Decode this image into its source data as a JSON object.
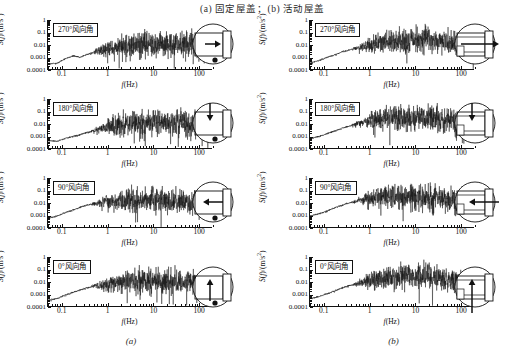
{
  "figure": {
    "top_caption_parts": [
      "(",
      "a",
      ") 固定屋盖；(",
      "b",
      ") 活动屋盖"
    ],
    "top_caption": "(a) 固定屋盖；(b) 活动屋盖",
    "bottom_caption_a": "(a)",
    "bottom_caption_b": "(b)",
    "axis": {
      "x_title_main": "f",
      "x_title_unit": "(Hz)",
      "y_title_main": "S",
      "y_title_var": "f",
      "y_title_unit": "/(m/s",
      "y_title_sup": "2",
      "y_title_close": ")",
      "x_ticks": [
        "0.1",
        "1",
        "10",
        "100"
      ],
      "y_ticks": [
        "1",
        "0.1",
        "0.01",
        "0.001",
        "0.0001"
      ],
      "x_range": [
        0.05,
        200
      ],
      "y_range": [
        0.0001,
        1
      ],
      "x_scale": "log",
      "y_scale": "log"
    },
    "columns": [
      {
        "id": "a",
        "name": "固定屋盖",
        "caption": "(a)",
        "roof_type": "fixed",
        "panels": [
          {
            "label": "270°风向角",
            "angle": 270,
            "arrow": "right"
          },
          {
            "label": "180°风向角",
            "angle": 180,
            "arrow": "down"
          },
          {
            "label": "90°风向角",
            "angle": 90,
            "arrow": "left"
          },
          {
            "label": "0°风向角",
            "angle": 0,
            "arrow": "up"
          }
        ]
      },
      {
        "id": "b",
        "name": "活动屋盖",
        "caption": "(b)",
        "roof_type": "movable",
        "panels": [
          {
            "label": "270°风向角",
            "angle": 270,
            "arrow": "right"
          },
          {
            "label": "180°风向角",
            "angle": 180,
            "arrow": "down"
          },
          {
            "label": "90°风向角",
            "angle": 90,
            "arrow": "left"
          },
          {
            "label": "0°风向角",
            "angle": 0,
            "arrow": "up"
          }
        ]
      }
    ]
  },
  "chart_data": [
    {
      "id": "a-270",
      "type": "line",
      "title": "270°风向角",
      "panel_column": "(a) 固定屋盖",
      "xlabel": "f(Hz)",
      "ylabel": "S(f)/(m/s2)",
      "xscale": "log",
      "yscale": "log",
      "xlim": [
        0.05,
        200
      ],
      "ylim": [
        0.0001,
        1
      ],
      "xticks": [
        0.1,
        1,
        10,
        100
      ],
      "yticks": [
        0.0001,
        0.001,
        0.01,
        0.1,
        1
      ],
      "grid": false,
      "legend": false,
      "series": [
        {
          "name": "加速度功率谱",
          "x": [
            0.05,
            0.08,
            0.12,
            0.18,
            0.25,
            0.35,
            0.5,
            0.7,
            1.0,
            1.5,
            2.0,
            3.0,
            5.0,
            8.0,
            12.0,
            20.0,
            30.0,
            50.0,
            80.0,
            100.0,
            130.0
          ],
          "y": [
            0.00025,
            0.0003,
            0.0007,
            0.0012,
            0.0009,
            0.0015,
            0.0022,
            0.0035,
            0.004,
            0.006,
            0.008,
            0.009,
            0.011,
            0.012,
            0.012,
            0.012,
            0.011,
            0.01,
            0.009,
            0.008,
            0.007
          ],
          "noise_band_db": 1.2
        }
      ]
    },
    {
      "id": "a-180",
      "type": "line",
      "title": "180°风向角",
      "panel_column": "(a) 固定屋盖",
      "xlabel": "f(Hz)",
      "ylabel": "S(f)/(m/s2)",
      "xscale": "log",
      "yscale": "log",
      "xlim": [
        0.05,
        200
      ],
      "ylim": [
        0.0001,
        1
      ],
      "xticks": [
        0.1,
        1,
        10,
        100
      ],
      "yticks": [
        0.0001,
        0.001,
        0.01,
        0.1,
        1
      ],
      "grid": false,
      "legend": false,
      "series": [
        {
          "name": "加速度功率谱",
          "x": [
            0.05,
            0.08,
            0.12,
            0.18,
            0.25,
            0.35,
            0.5,
            0.7,
            1.0,
            1.5,
            2.0,
            3.0,
            5.0,
            8.0,
            12.0,
            20.0,
            30.0,
            50.0,
            80.0,
            100.0,
            130.0
          ],
          "y": [
            0.0004,
            0.00035,
            0.0006,
            0.0009,
            0.0012,
            0.0018,
            0.0025,
            0.0035,
            0.005,
            0.007,
            0.009,
            0.01,
            0.012,
            0.013,
            0.013,
            0.012,
            0.011,
            0.01,
            0.009,
            0.008,
            0.007
          ],
          "noise_band_db": 1.2
        }
      ]
    },
    {
      "id": "a-90",
      "type": "line",
      "title": "90°风向角",
      "panel_column": "(a) 固定屋盖",
      "xlabel": "f(Hz)",
      "ylabel": "S(f)/(m/s2)",
      "xscale": "log",
      "yscale": "log",
      "xlim": [
        0.05,
        200
      ],
      "ylim": [
        0.0001,
        1
      ],
      "xticks": [
        0.1,
        1,
        10,
        100
      ],
      "yticks": [
        0.0001,
        0.001,
        0.01,
        0.1,
        1
      ],
      "grid": false,
      "legend": false,
      "series": [
        {
          "name": "加速度功率谱",
          "x": [
            0.05,
            0.08,
            0.12,
            0.18,
            0.25,
            0.35,
            0.5,
            0.7,
            1.0,
            1.5,
            2.0,
            3.0,
            5.0,
            8.0,
            12.0,
            20.0,
            30.0,
            50.0,
            80.0,
            100.0,
            130.0
          ],
          "y": [
            0.0005,
            0.0008,
            0.0015,
            0.0025,
            0.004,
            0.006,
            0.008,
            0.01,
            0.012,
            0.014,
            0.015,
            0.016,
            0.017,
            0.017,
            0.016,
            0.015,
            0.014,
            0.012,
            0.01,
            0.009,
            0.008
          ],
          "noise_band_db": 1.2
        }
      ]
    },
    {
      "id": "a-0",
      "type": "line",
      "title": "0°风向角",
      "panel_column": "(a) 固定屋盖",
      "xlabel": "f(Hz)",
      "ylabel": "S(f)/(m/s2)",
      "xscale": "log",
      "yscale": "log",
      "xlim": [
        0.05,
        200
      ],
      "ylim": [
        0.0001,
        1
      ],
      "xticks": [
        0.1,
        1,
        10,
        100
      ],
      "yticks": [
        0.0001,
        0.001,
        0.01,
        0.1,
        1
      ],
      "grid": false,
      "legend": false,
      "series": [
        {
          "name": "加速度功率谱",
          "x": [
            0.05,
            0.08,
            0.12,
            0.18,
            0.25,
            0.35,
            0.5,
            0.7,
            1.0,
            1.5,
            2.0,
            3.0,
            5.0,
            8.0,
            12.0,
            20.0,
            30.0,
            50.0,
            80.0,
            100.0,
            130.0
          ],
          "y": [
            0.0003,
            0.0004,
            0.0008,
            0.0013,
            0.002,
            0.003,
            0.004,
            0.005,
            0.006,
            0.008,
            0.009,
            0.01,
            0.011,
            0.012,
            0.012,
            0.011,
            0.01,
            0.009,
            0.008,
            0.007,
            0.006
          ],
          "noise_band_db": 1.2
        }
      ]
    },
    {
      "id": "b-270",
      "type": "line",
      "title": "270°风向角",
      "panel_column": "(b) 活动屋盖",
      "xlabel": "f(Hz)",
      "ylabel": "S(f)/(m/s2)",
      "xscale": "log",
      "yscale": "log",
      "xlim": [
        0.05,
        200
      ],
      "ylim": [
        0.0001,
        1
      ],
      "xticks": [
        0.1,
        1,
        10,
        100
      ],
      "yticks": [
        0.0001,
        0.001,
        0.01,
        0.1,
        1
      ],
      "grid": false,
      "legend": false,
      "series": [
        {
          "name": "加速度功率谱",
          "x": [
            0.05,
            0.08,
            0.12,
            0.18,
            0.25,
            0.35,
            0.5,
            0.7,
            1.0,
            1.5,
            2.0,
            3.0,
            5.0,
            8.0,
            12.0,
            20.0,
            30.0,
            50.0,
            80.0,
            100.0,
            130.0
          ],
          "y": [
            0.0003,
            0.0005,
            0.0009,
            0.0015,
            0.0025,
            0.0035,
            0.005,
            0.007,
            0.009,
            0.012,
            0.015,
            0.018,
            0.022,
            0.028,
            0.032,
            0.03,
            0.025,
            0.018,
            0.012,
            0.01,
            0.008
          ],
          "noise_band_db": 1.3
        }
      ]
    },
    {
      "id": "b-180",
      "type": "line",
      "title": "180°风向角",
      "panel_column": "(b) 活动屋盖",
      "xlabel": "f(Hz)",
      "ylabel": "S(f)/(m/s2)",
      "xscale": "log",
      "yscale": "log",
      "xlim": [
        0.05,
        200
      ],
      "ylim": [
        0.0001,
        1
      ],
      "xticks": [
        0.1,
        1,
        10,
        100
      ],
      "yticks": [
        0.0001,
        0.001,
        0.01,
        0.1,
        1
      ],
      "grid": false,
      "legend": false,
      "series": [
        {
          "name": "加速度功率谱",
          "x": [
            0.05,
            0.08,
            0.12,
            0.18,
            0.25,
            0.35,
            0.5,
            0.7,
            1.0,
            1.5,
            2.0,
            3.0,
            5.0,
            8.0,
            12.0,
            20.0,
            30.0,
            50.0,
            80.0,
            100.0,
            130.0
          ],
          "y": [
            0.0006,
            0.0009,
            0.0015,
            0.0025,
            0.004,
            0.006,
            0.009,
            0.012,
            0.016,
            0.02,
            0.024,
            0.028,
            0.032,
            0.035,
            0.034,
            0.03,
            0.025,
            0.018,
            0.012,
            0.01,
            0.008
          ],
          "noise_band_db": 1.3
        }
      ]
    },
    {
      "id": "b-90",
      "type": "line",
      "title": "90°风向角",
      "panel_column": "(b) 活动屋盖",
      "xlabel": "f(Hz)",
      "ylabel": "S(f)/(m/s2)",
      "xscale": "log",
      "yscale": "log",
      "xlim": [
        0.05,
        200
      ],
      "ylim": [
        0.0001,
        1
      ],
      "xticks": [
        0.1,
        1,
        10,
        100
      ],
      "yticks": [
        0.0001,
        0.001,
        0.01,
        0.1,
        1
      ],
      "grid": false,
      "legend": false,
      "series": [
        {
          "name": "加速度功率谱",
          "x": [
            0.05,
            0.08,
            0.12,
            0.18,
            0.25,
            0.35,
            0.5,
            0.7,
            1.0,
            1.5,
            2.0,
            3.0,
            5.0,
            8.0,
            12.0,
            20.0,
            30.0,
            50.0,
            80.0,
            100.0,
            130.0
          ],
          "y": [
            0.0008,
            0.0012,
            0.002,
            0.004,
            0.006,
            0.009,
            0.012,
            0.016,
            0.02,
            0.025,
            0.028,
            0.032,
            0.035,
            0.036,
            0.034,
            0.03,
            0.026,
            0.02,
            0.014,
            0.011,
            0.009
          ],
          "noise_band_db": 1.3
        }
      ]
    },
    {
      "id": "b-0",
      "type": "line",
      "title": "0°风向角",
      "panel_column": "(b) 活动屋盖",
      "xlabel": "f(Hz)",
      "ylabel": "S(f)/(m/s2)",
      "xscale": "log",
      "yscale": "log",
      "xlim": [
        0.05,
        200
      ],
      "ylim": [
        0.0001,
        1
      ],
      "xticks": [
        0.1,
        1,
        10,
        100
      ],
      "yticks": [
        0.0001,
        0.001,
        0.01,
        0.1,
        1
      ],
      "grid": false,
      "legend": false,
      "series": [
        {
          "name": "加速度功率谱",
          "x": [
            0.05,
            0.08,
            0.12,
            0.18,
            0.25,
            0.35,
            0.5,
            0.7,
            1.0,
            1.5,
            2.0,
            3.0,
            5.0,
            8.0,
            12.0,
            20.0,
            30.0,
            50.0,
            80.0,
            100.0,
            130.0
          ],
          "y": [
            0.0004,
            0.0006,
            0.001,
            0.0018,
            0.003,
            0.0045,
            0.006,
            0.009,
            0.012,
            0.016,
            0.019,
            0.022,
            0.026,
            0.03,
            0.03,
            0.027,
            0.023,
            0.017,
            0.012,
            0.01,
            0.008
          ],
          "noise_band_db": 1.3
        }
      ]
    }
  ]
}
